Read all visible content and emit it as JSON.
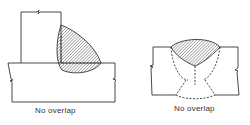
{
  "figures": [
    {
      "id": "fillet-weld",
      "caption": "No overlap"
    },
    {
      "id": "groove-weld",
      "caption": "No overlap"
    }
  ],
  "colors": {
    "ink": "#333333",
    "paper": "#ffffff"
  }
}
